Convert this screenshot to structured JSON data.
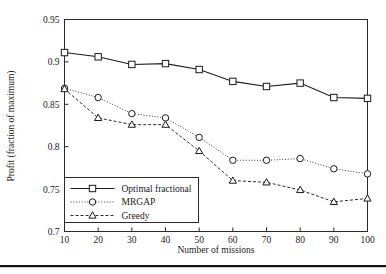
{
  "chart_data": {
    "type": "line",
    "title": "",
    "xlabel": "Number of missions",
    "ylabel": "Profit (fraction of maximum)",
    "x": [
      10,
      20,
      30,
      40,
      50,
      60,
      70,
      80,
      90,
      100
    ],
    "xlim": [
      10,
      100
    ],
    "ylim": [
      0.7,
      0.95
    ],
    "xticks": [
      "10",
      "20",
      "30",
      "40",
      "50",
      "60",
      "70",
      "80",
      "90",
      "100"
    ],
    "yticks": [
      "0.7",
      "0.75",
      "0.8",
      "0.85",
      "0.9",
      "0.95"
    ],
    "ytick_values": [
      0.7,
      0.75,
      0.8,
      0.85,
      0.9,
      0.95
    ],
    "grid": false,
    "legend_position": "lower left",
    "series": [
      {
        "name": "Optimal fractional",
        "marker": "square",
        "linestyle": "solid",
        "values": [
          0.911,
          0.906,
          0.897,
          0.898,
          0.891,
          0.877,
          0.871,
          0.875,
          0.858,
          0.857
        ]
      },
      {
        "name": "MRGAP",
        "marker": "circle",
        "linestyle": "dotted",
        "values": [
          0.869,
          0.858,
          0.839,
          0.834,
          0.811,
          0.784,
          0.784,
          0.786,
          0.774,
          0.768
        ]
      },
      {
        "name": "Greedy",
        "marker": "triangle",
        "linestyle": "dashed",
        "values": [
          0.868,
          0.834,
          0.826,
          0.826,
          0.795,
          0.76,
          0.758,
          0.749,
          0.735,
          0.739
        ]
      }
    ]
  },
  "legend": {
    "entries": [
      {
        "label": "Optimal fractional"
      },
      {
        "label": "MRGAP"
      },
      {
        "label": "Greedy"
      }
    ]
  },
  "colors": {
    "axis": "#2b2b2b",
    "text": "#1a1a1a",
    "series_optimal": "#1a1a1a",
    "series_mrgap": "#3a3a3a",
    "series_greedy": "#2b2b2b",
    "background": "#ffffff",
    "footer_rule": "#101010"
  }
}
